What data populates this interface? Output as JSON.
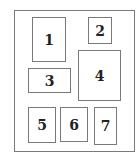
{
  "diagram": {
    "title": "",
    "boxes": [
      {
        "label": "1"
      },
      {
        "label": "2"
      },
      {
        "label": "3"
      },
      {
        "label": "4"
      },
      {
        "label": "5"
      },
      {
        "label": "6"
      },
      {
        "label": "7"
      }
    ]
  }
}
